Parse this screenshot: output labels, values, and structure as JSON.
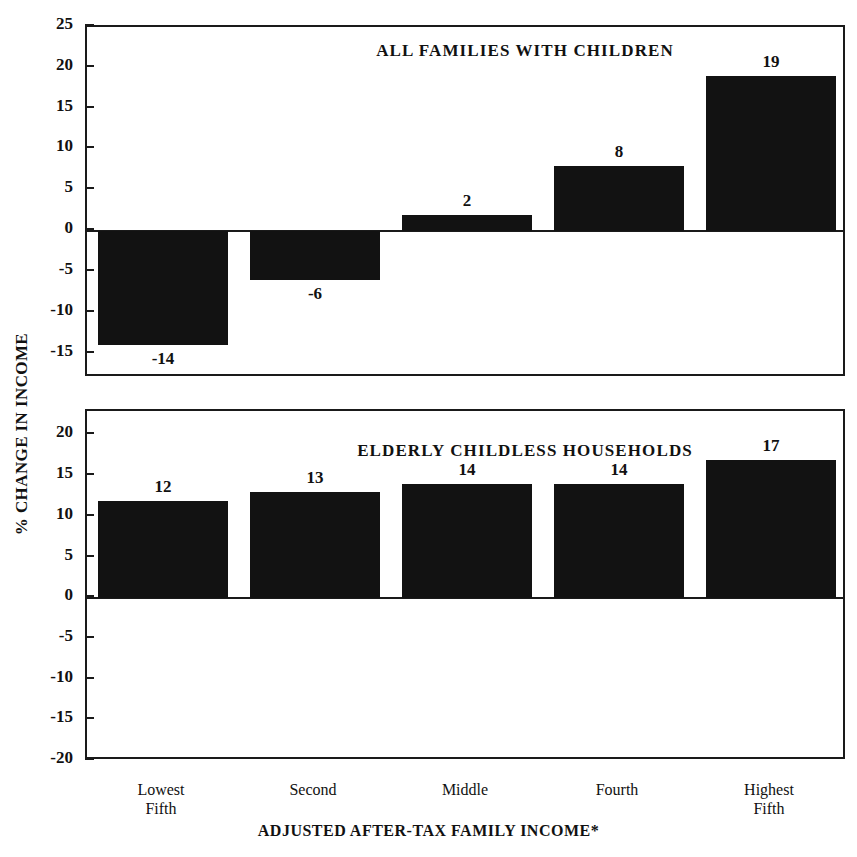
{
  "chart_data": {
    "type": "bar",
    "title": "",
    "xlabel": "ADJUSTED AFTER-TAX FAMILY INCOME*",
    "ylabel": "% CHANGE IN INCOME",
    "categories": [
      "Lowest\nFifth",
      "Second",
      "Middle",
      "Fourth",
      "Highest\nFifth"
    ],
    "grid": false,
    "legend": "none",
    "panels": [
      {
        "title": "ALL FAMILIES WITH CHILDREN",
        "values": [
          -14,
          -6,
          2,
          8,
          19
        ],
        "labels": [
          "-14",
          "-6",
          "2",
          "8",
          "19"
        ],
        "ylim": [
          -18,
          25
        ],
        "yticks": [
          25,
          20,
          15,
          10,
          5,
          0,
          -5,
          -10,
          -15
        ],
        "yticklabels": [
          "25",
          "20",
          "15",
          "10",
          "5",
          "0",
          "-5",
          "-10",
          "-15"
        ]
      },
      {
        "title": "ELDERLY CHILDLESS HOUSEHOLDS",
        "values": [
          12,
          13,
          14,
          14,
          17
        ],
        "labels": [
          "12",
          "13",
          "14",
          "14",
          "17"
        ],
        "ylim": [
          -20,
          23
        ],
        "yticks": [
          20,
          15,
          10,
          5,
          0,
          -5,
          -10,
          -15,
          -20
        ],
        "yticklabels": [
          "20",
          "15",
          "10",
          "5",
          "0",
          "-5",
          "-10",
          "-15",
          "-20"
        ]
      }
    ],
    "colors": {
      "bar": "#121212",
      "axis": "#1a1a1a",
      "background": "#ffffff",
      "text": "#111111"
    }
  }
}
